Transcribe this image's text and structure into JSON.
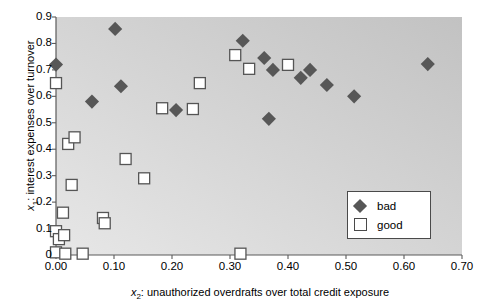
{
  "chart_data": {
    "type": "scatter",
    "title": "",
    "xlabel": "x2: unauthorized overdrafts over total credit exposure",
    "ylabel": "x1: interest expenses over turnover",
    "xlim": [
      0.0,
      0.7
    ],
    "ylim": [
      0.0,
      0.9
    ],
    "xticks": [
      "0.00",
      "0.10",
      "0.20",
      "0.30",
      "0.40",
      "0.50",
      "0.60",
      "0.70"
    ],
    "xtick_values": [
      0.0,
      0.1,
      0.2,
      0.3,
      0.4,
      0.5,
      0.6,
      0.7
    ],
    "yticks": [
      "0",
      "0.1",
      "0.2",
      "0.3",
      "0.4",
      "0.5",
      "0.6",
      "0.7",
      "0.8",
      "0.9"
    ],
    "ytick_values": [
      0.0,
      0.1,
      0.2,
      0.3,
      0.4,
      0.5,
      0.6,
      0.7,
      0.8,
      0.9
    ],
    "grid": false,
    "legend_position": "lower-right",
    "plot_background": "#cfcfcf",
    "series": [
      {
        "name": "bad",
        "marker": "filled-diamond",
        "color": "#575757",
        "points": [
          [
            0.0,
            0.72
          ],
          [
            0.062,
            0.58
          ],
          [
            0.102,
            0.855
          ],
          [
            0.112,
            0.638
          ],
          [
            0.207,
            0.548
          ],
          [
            0.322,
            0.81
          ],
          [
            0.359,
            0.745
          ],
          [
            0.367,
            0.515
          ],
          [
            0.374,
            0.7
          ],
          [
            0.422,
            0.67
          ],
          [
            0.438,
            0.7
          ],
          [
            0.467,
            0.643
          ],
          [
            0.514,
            0.6
          ],
          [
            0.641,
            0.722
          ]
        ]
      },
      {
        "name": "good",
        "marker": "open-square",
        "color": "#555555",
        "points": [
          [
            0.0,
            0.65
          ],
          [
            0.0,
            0.09
          ],
          [
            0.0,
            0.01
          ],
          [
            0.005,
            0.06
          ],
          [
            0.012,
            0.16
          ],
          [
            0.014,
            0.075
          ],
          [
            0.016,
            0.005
          ],
          [
            0.021,
            0.42
          ],
          [
            0.027,
            0.265
          ],
          [
            0.032,
            0.445
          ],
          [
            0.046,
            0.005
          ],
          [
            0.081,
            0.14
          ],
          [
            0.084,
            0.12
          ],
          [
            0.12,
            0.363
          ],
          [
            0.152,
            0.29
          ],
          [
            0.183,
            0.555
          ],
          [
            0.236,
            0.552
          ],
          [
            0.248,
            0.65
          ],
          [
            0.309,
            0.756
          ],
          [
            0.318,
            0.005
          ],
          [
            0.333,
            0.704
          ],
          [
            0.4,
            0.719
          ]
        ]
      }
    ]
  },
  "legend": {
    "items": [
      {
        "label": "bad",
        "marker": "filled-diamond"
      },
      {
        "label": "good",
        "marker": "open-square"
      }
    ]
  },
  "axis_labels": {
    "x_prefix": "x",
    "x_sub": "2",
    "x_rest": ": unauthorized overdrafts over total credit exposure",
    "y_prefix": "x",
    "y_sub": "1",
    "y_rest": ": interest expenses over turnover"
  }
}
